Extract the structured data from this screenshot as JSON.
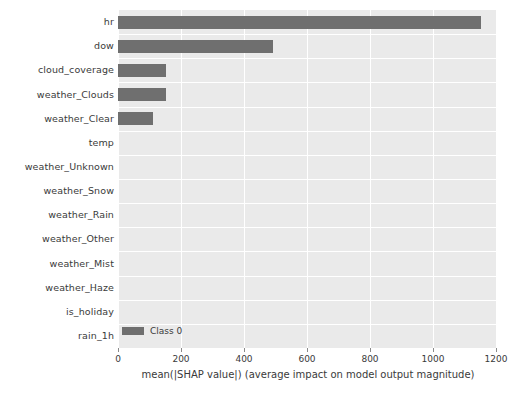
{
  "chart_data": {
    "type": "bar",
    "orientation": "horizontal",
    "title": "",
    "xlabel": "mean(|SHAP value|) (average impact on model output magnitude)",
    "ylabel": "",
    "xlim": [
      0,
      1200
    ],
    "xticks": [
      0,
      200,
      400,
      600,
      800,
      1000,
      1200
    ],
    "xticklabels": [
      "0",
      "200",
      "400",
      "600",
      "800",
      "1000",
      "1200"
    ],
    "grid": true,
    "grid_color": "#ffffff",
    "plot_background": "#eaeaea",
    "bar_color": "#6f6f6f",
    "legend": {
      "position": "lower left",
      "entries": [
        {
          "label": "Class 0",
          "color": "#6f6f6f"
        }
      ]
    },
    "categories": [
      "hr",
      "dow",
      "cloud_coverage",
      "weather_Clouds",
      "weather_Clear",
      "temp",
      "weather_Unknown",
      "weather_Snow",
      "weather_Rain",
      "weather_Other",
      "weather_Mist",
      "weather_Haze",
      "is_holiday",
      "rain_1h"
    ],
    "series": [
      {
        "name": "Class 0",
        "values": [
          1151,
          492,
          151,
          151,
          112,
          0,
          0,
          0,
          0,
          0,
          0,
          0,
          0,
          0
        ]
      }
    ]
  }
}
